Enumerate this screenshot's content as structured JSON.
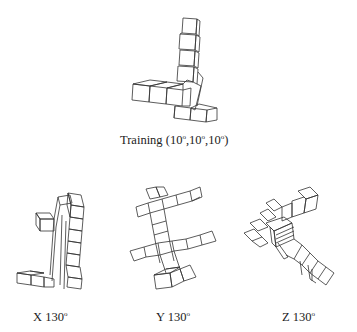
{
  "figure": {
    "training": {
      "label_prefix": "Training (10",
      "label_sep1": ",10",
      "label_sep2": ",10",
      "label_suffix": ")",
      "degree_symbol": "o"
    },
    "panels": [
      {
        "axis": "X",
        "angle": "130",
        "degree_symbol": "o"
      },
      {
        "axis": "Y",
        "angle": "130",
        "degree_symbol": "o"
      },
      {
        "axis": "Z",
        "angle": "130",
        "degree_symbol": "o"
      }
    ]
  }
}
